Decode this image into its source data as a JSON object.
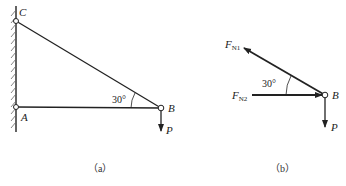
{
  "figure_a": {
    "caption": "（a）",
    "points": {
      "C": "C",
      "A": "A",
      "B": "B"
    },
    "angle": "30°",
    "load": "P"
  },
  "figure_b": {
    "caption": "（b）",
    "force1": {
      "main": "F",
      "sub": "N1"
    },
    "force2": {
      "main": "F",
      "sub": "N2"
    },
    "point": "B",
    "angle": "30°",
    "load": "P"
  },
  "colors": {
    "line": "#222222",
    "hatch": "#555555"
  }
}
